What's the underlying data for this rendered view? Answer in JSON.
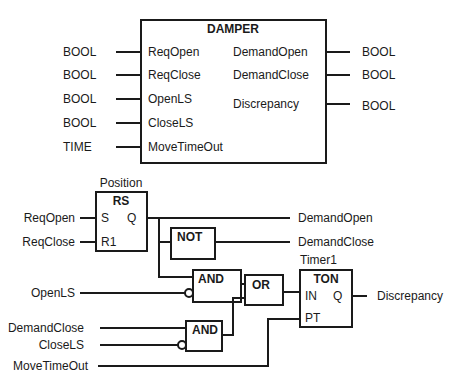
{
  "damper_block": {
    "title": "DAMPER",
    "inputs": [
      {
        "name": "ReqOpen",
        "type": "BOOL"
      },
      {
        "name": "ReqClose",
        "type": "BOOL"
      },
      {
        "name": "OpenLS",
        "type": "BOOL"
      },
      {
        "name": "CloseLS",
        "type": "BOOL"
      },
      {
        "name": "MoveTimeOut",
        "type": "TIME"
      }
    ],
    "outputs": [
      {
        "name": "DemandOpen",
        "type": "BOOL"
      },
      {
        "name": "DemandClose",
        "type": "BOOL"
      },
      {
        "name": "Discrepancy",
        "type": "BOOL"
      }
    ]
  },
  "logic": {
    "rs_block": {
      "instance": "Position",
      "type": "RS",
      "pin_s": "S",
      "pin_r1": "R1",
      "pin_q": "Q"
    },
    "not_gate": {
      "type": "NOT"
    },
    "and_gate_1": {
      "type": "AND"
    },
    "and_gate_2": {
      "type": "AND"
    },
    "or_gate": {
      "type": "OR"
    },
    "ton_block": {
      "instance": "Timer1",
      "type": "TON",
      "pin_in": "IN",
      "pin_pt": "PT",
      "pin_q": "Q"
    },
    "signals": {
      "req_open": "ReqOpen",
      "req_close": "ReqClose",
      "open_ls": "OpenLS",
      "demand_close_in": "DemandClose",
      "close_ls": "CloseLS",
      "move_timeout": "MoveTimeOut",
      "demand_open_out": "DemandOpen",
      "demand_close_out": "DemandClose",
      "discrepancy_out": "Discrepancy"
    }
  }
}
